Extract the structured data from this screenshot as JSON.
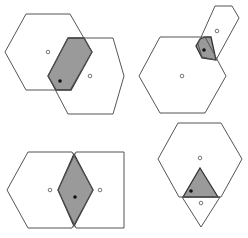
{
  "diagram": {
    "colors": {
      "background": "#ffffff",
      "outline": "#555555",
      "shaded_fill": "#9a9a9a",
      "shaded_stroke": "#333333",
      "dot": "#111111"
    },
    "panels": [
      {
        "id": "top-left",
        "outlines": [
          "26,14 70,14 92,52 70,90 26,90 5,52",
          "68,38 113,38 124,76 113,114 68,114 48,76"
        ],
        "shaded": "68,38 84,38 92,52 71,90 56,90 48,76",
        "open_points": [
          [
            48,
            52
          ],
          [
            90,
            76
          ]
        ],
        "filled_points": [
          [
            60,
            81
          ]
        ]
      },
      {
        "id": "top-right",
        "outlines": [
          "160,37 205,37 226,76 205,113 160,113 139,76",
          "215,6 232,6 239,18 216,60 202,57 198,44"
        ],
        "shaded": "205,37 211,37 216,60 202,58 196,46 200,39",
        "open_points": [
          [
            182,
            76
          ],
          [
            217,
            31
          ]
        ],
        "filled_points": [
          [
            204,
            50
          ]
        ]
      },
      {
        "id": "bottom-left",
        "outlines": [
          "28,152 72,152 93,190 72,228 28,228 7,190",
          "76,152 120,152 124,152 124,228 120,228 76,228 58,190"
        ],
        "shaded": "74,154 93,190 74,226 58,190",
        "open_points": [
          [
            50,
            190
          ],
          [
            100,
            190
          ]
        ],
        "filled_points": [
          [
            75,
            197
          ]
        ]
      },
      {
        "id": "bottom-right",
        "outlines": [
          "178,123 221,123 242,159 221,197 179,197 158,159",
          "182,197 220,197 201,227"
        ],
        "shaded": "200,168 218,197 183,197",
        "open_points": [
          [
            200,
            158
          ],
          [
            201,
            203
          ]
        ],
        "filled_points": [
          [
            191,
            191
          ]
        ]
      }
    ]
  }
}
